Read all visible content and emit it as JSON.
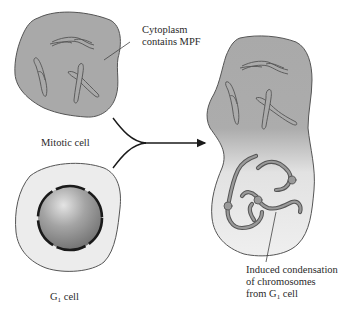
{
  "figure": {
    "labels": {
      "cytoplasm_line1": "Cytoplasm",
      "cytoplasm_line2": "contains MPF",
      "mitotic_cell": "Mitotic cell",
      "g1_prefix": "G",
      "g1_sub": "1",
      "g1_suffix": " cell",
      "induced_line1": "Induced condensation",
      "induced_line2": "of chromosomes",
      "induced_line3_prefix": "from G",
      "induced_line3_sub": "1",
      "induced_line3_suffix": " cell"
    },
    "colors": {
      "mitotic_cytoplasm": "#a9a9a9",
      "g1_cytoplasm": "#ececec",
      "nucleus": "#8c8c8c",
      "outline": "#555555",
      "envelope": "#1a1a1a",
      "chromosome_fill": "#9a9a9a",
      "chromosome_stroke": "#555555"
    }
  }
}
